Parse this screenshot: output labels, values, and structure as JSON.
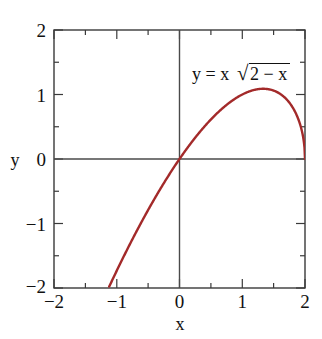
{
  "chart_data": {
    "type": "line",
    "title": "",
    "annotation": "y = x √(2 − x)",
    "annotation_parts": {
      "lhs": "y = x",
      "radical": "√",
      "radicand": "2 − x"
    },
    "xlabel": "x",
    "ylabel": "y",
    "xlim": [
      -2,
      2
    ],
    "ylim": [
      -2,
      2
    ],
    "xticks": [
      -2,
      -1,
      0,
      1,
      2
    ],
    "yticks": [
      -2,
      -1,
      0,
      1,
      2
    ],
    "xtick_labels": [
      "−2",
      "−1",
      "0",
      "1",
      "2"
    ],
    "ytick_labels": [
      "−2",
      "−1",
      "0",
      "1",
      "2"
    ],
    "minor_tick_step": 0.5,
    "grid": false,
    "legend": null,
    "zero_axes": true,
    "frame": true,
    "series": [
      {
        "name": "y = x sqrt(2 - x)",
        "color": "#a32a2a",
        "line_width": 2.4,
        "domain": [
          -1.1,
          2.0
        ],
        "x": [
          -1.1,
          -1.05,
          -1.0,
          -0.95,
          -0.9,
          -0.85,
          -0.8,
          -0.75,
          -0.7,
          -0.65,
          -0.6,
          -0.55,
          -0.5,
          -0.45,
          -0.4,
          -0.35,
          -0.3,
          -0.25,
          -0.2,
          -0.15,
          -0.1,
          -0.05,
          0.0,
          0.05,
          0.1,
          0.15,
          0.2,
          0.25,
          0.3,
          0.35,
          0.4,
          0.45,
          0.5,
          0.55,
          0.6,
          0.65,
          0.7,
          0.75,
          0.8,
          0.85,
          0.9,
          0.95,
          1.0,
          1.05,
          1.1,
          1.15,
          1.2,
          1.25,
          1.3,
          1.3333,
          1.35,
          1.4,
          1.45,
          1.5,
          1.55,
          1.6,
          1.65,
          1.7,
          1.75,
          1.8,
          1.85,
          1.9,
          1.92,
          1.94,
          1.96,
          1.97,
          1.98,
          1.99,
          2.0
        ],
        "y": [
          -2.006,
          -1.918,
          -1.832,
          -1.746,
          -1.661,
          -1.578,
          -1.495,
          -1.414,
          -1.334,
          -1.255,
          -1.177,
          -1.1,
          -1.025,
          -0.951,
          -0.877,
          -0.805,
          -0.734,
          -0.664,
          -0.594,
          -0.526,
          -0.458,
          -0.392,
          0.0,
          0.07,
          0.138,
          0.206,
          0.272,
          0.337,
          0.402,
          0.465,
          0.527,
          0.588,
          0.648,
          0.707,
          0.765,
          0.821,
          0.877,
          0.931,
          0.985,
          1.036,
          1.086,
          1.134,
          1.18,
          1.224,
          1.265,
          1.303,
          1.337,
          1.368,
          1.393,
          1.3999,
          1.399,
          1.396,
          1.382,
          1.354,
          1.309,
          1.247,
          1.164,
          1.057,
          0.919,
          0.739,
          0.493,
          0.0,
          0.0,
          0.0,
          0.0,
          0.0,
          0.0,
          0.0,
          0.0
        ]
      }
    ]
  },
  "axes": {
    "x_axis_title": "x",
    "y_axis_title": "y"
  },
  "annotation_label": {
    "lhs": "y = x",
    "radical_glyph": "√",
    "radicand": "2 − x"
  },
  "colors": {
    "curve": "#a32a2a",
    "frame": "#3a3a3a",
    "zero_axis": "#4a4a4a",
    "text": "#111111",
    "background": "#ffffff"
  }
}
